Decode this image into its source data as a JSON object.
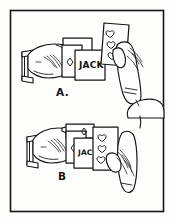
{
  "figure": {
    "style": "line-art",
    "colors": {
      "ink": "#1a1a1a",
      "paper": "#fdfdfc",
      "card": "#ffffff",
      "frame": "#141414"
    },
    "border": {
      "name": "outer-frame",
      "stroke_width": 1.6,
      "inset": 10
    }
  },
  "panels": [
    {
      "id": "panel-a",
      "label": "A.",
      "label_x": 56,
      "label_y": 96,
      "cards": [
        {
          "name": "fan-card-back-left",
          "word": "",
          "pip": "none"
        },
        {
          "name": "diamond-card",
          "word": "",
          "pip": "diamond"
        },
        {
          "name": "jack-card",
          "word": "JACK",
          "word_x": 79,
          "word_y": 67,
          "pip": "none"
        },
        {
          "name": "hearts-card",
          "word": "",
          "pip": "heart",
          "pip_count": 3
        }
      ],
      "hands": [
        {
          "name": "left-hand-with-cuff",
          "side": "left"
        },
        {
          "name": "right-hand-holding-card",
          "side": "right"
        }
      ]
    },
    {
      "id": "panel-b",
      "label": "B",
      "label_x": 58,
      "label_y": 180,
      "cards": [
        {
          "name": "fan-card-back-left",
          "word": "",
          "pip": "none"
        },
        {
          "name": "diamond-card",
          "word": "",
          "pip": "diamond"
        },
        {
          "name": "jac-card",
          "word": "JAC",
          "word_x": 78,
          "word_y": 154,
          "pip": "none"
        },
        {
          "name": "hearts-card",
          "word": "",
          "pip": "heart",
          "pip_count": 3
        }
      ],
      "hands": [
        {
          "name": "left-hand-with-cuff",
          "side": "left"
        },
        {
          "name": "right-hand-holding-card",
          "side": "right"
        }
      ]
    }
  ]
}
